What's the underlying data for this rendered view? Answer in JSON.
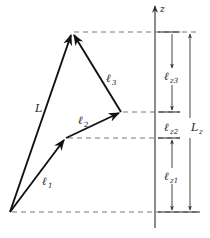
{
  "figure": {
    "axis": {
      "label": "z"
    },
    "vectors": [
      {
        "id": "l1",
        "label": "ℓ",
        "subscript": "1"
      },
      {
        "id": "l2",
        "label": "ℓ",
        "subscript": "2"
      },
      {
        "id": "l3",
        "label": "ℓ",
        "subscript": "3"
      },
      {
        "id": "L",
        "label": "L",
        "subscript": ""
      }
    ],
    "components": [
      {
        "id": "lz3",
        "label": "ℓ",
        "subscript": "z3"
      },
      {
        "id": "lz2",
        "label": "ℓ",
        "subscript": "z2"
      },
      {
        "id": "lz1",
        "label": "ℓ",
        "subscript": "z1"
      }
    ],
    "total_component": {
      "label": "L",
      "subscript": "z"
    }
  }
}
